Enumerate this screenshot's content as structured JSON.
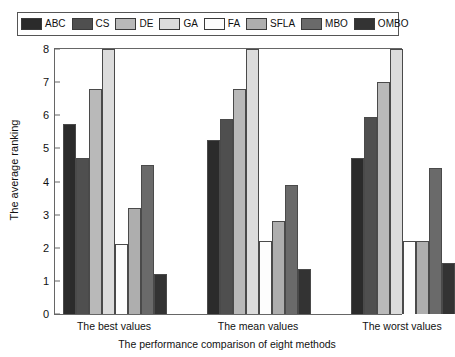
{
  "chart_data": {
    "type": "bar",
    "title": "",
    "xlabel": "The performance comparison of eight methods",
    "ylabel": "The average ranking",
    "categories": [
      "The best values",
      "The mean values",
      "The worst values"
    ],
    "ylim": [
      0,
      8
    ],
    "yticks": [
      "0",
      "1",
      "2",
      "3",
      "4",
      "5",
      "6",
      "7",
      "8"
    ],
    "grid": false,
    "legend_position": "top",
    "series": [
      {
        "name": "ABC",
        "color": "#2b2b2b",
        "values": [
          5.75,
          5.25,
          4.7
        ]
      },
      {
        "name": "CS",
        "color": "#4f4f4f",
        "values": [
          4.7,
          5.9,
          5.95
        ]
      },
      {
        "name": "DE",
        "color": "#b9b9b9",
        "values": [
          6.8,
          6.8,
          7.0
        ]
      },
      {
        "name": "GA",
        "color": "#dcdcdc",
        "values": [
          8.0,
          8.0,
          8.0
        ]
      },
      {
        "name": "FA",
        "color": "#fdfdfd",
        "values": [
          2.1,
          2.2,
          2.2
        ]
      },
      {
        "name": "SFLA",
        "color": "#aeaeae",
        "values": [
          3.2,
          2.8,
          2.2
        ]
      },
      {
        "name": "MBO",
        "color": "#6a6a6a",
        "values": [
          4.5,
          3.9,
          4.4
        ]
      },
      {
        "name": "OMBO",
        "color": "#333333",
        "values": [
          1.2,
          1.35,
          1.55
        ]
      }
    ]
  },
  "legend": {
    "items": [
      {
        "label": "ABC",
        "color": "#2b2b2b"
      },
      {
        "label": "CS",
        "color": "#4f4f4f"
      },
      {
        "label": "DE",
        "color": "#b9b9b9"
      },
      {
        "label": "GA",
        "color": "#dcdcdc"
      },
      {
        "label": "FA",
        "color": "#fdfdfd"
      },
      {
        "label": "SFLA",
        "color": "#aeaeae"
      },
      {
        "label": "MBO",
        "color": "#6a6a6a"
      },
      {
        "label": "OMBO",
        "color": "#333333"
      }
    ]
  }
}
